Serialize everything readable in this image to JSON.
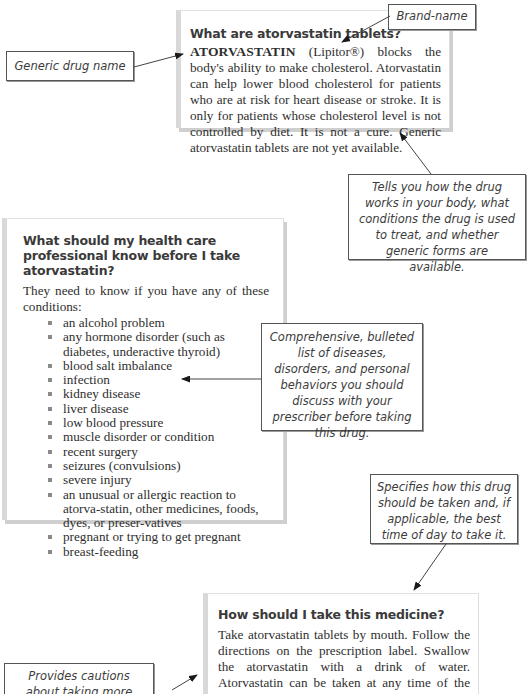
{
  "panel_1": {
    "title": "What are atorvastatin tablets?",
    "drug_name": "ATORVASTATIN",
    "brand": "(Lipitor®)",
    "body": "blocks the body's ability to make cholesterol. Atorvastatin can help lower blood cholesterol for patients who are at risk for heart disease or stroke. It is only for patients whose cholesterol level is not controlled by diet. It is not a cure. Generic atorvastatin tablets are not yet available."
  },
  "panel_2": {
    "title": "What should my health care professional know before I take atorvastatin?",
    "intro": "They need to know if you have any of these conditions:",
    "conditions": [
      "an alcohol problem",
      "any hormone disorder (such as diabetes, underactive thyroid)",
      "blood salt imbalance",
      "infection",
      "kidney disease",
      "liver disease",
      "low blood pressure",
      "muscle disorder or condition",
      "recent surgery",
      "seizures (convulsions)",
      "severe injury",
      "an unusual or allergic reaction to atorva-statin, other medicines, foods, dyes, or preser-vatives",
      "pregnant or trying to get pregnant",
      "breast-feeding"
    ]
  },
  "panel_3": {
    "title": "How should I take this medicine?",
    "body": "Take atorvastatin tablets by mouth. Follow the directions on the prescription label. Swallow the atorvastatin with a drink of water. Atorvastatin can be taken at any time of the day with or without food. Take your doses at regular intervals. Do not"
  },
  "callouts": {
    "brand_name": "Brand-name",
    "generic_name": "Generic drug name",
    "how_it_works": "Tells you how the drug works in your body, what conditions the drug is used to treat, and whether generic forms are available.",
    "conditions_list": "Comprehensive, bulleted list of diseases, disorders, and personal behaviors you should discuss with your prescriber before taking this drug.",
    "how_to_take": "Specifies how this drug should be taken and, if applicable, the best time of day to take it.",
    "cautions": "Provides cautions about taking more often than"
  }
}
